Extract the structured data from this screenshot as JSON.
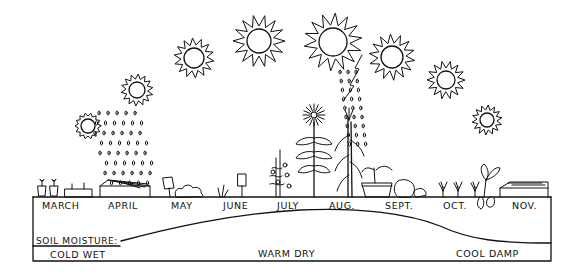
{
  "diagram": {
    "type": "garden-season-illustration",
    "months": [
      {
        "label": "MARCH",
        "x": 42
      },
      {
        "label": "APRIL",
        "x": 108
      },
      {
        "label": "MAY",
        "x": 171
      },
      {
        "label": "JUNE",
        "x": 223
      },
      {
        "label": "JULY",
        "x": 277
      },
      {
        "label": "AUG.",
        "x": 329
      },
      {
        "label": "SEPT.",
        "x": 385
      },
      {
        "label": "OCT.",
        "x": 443
      },
      {
        "label": "NOV.",
        "x": 512
      }
    ],
    "soil_moisture": {
      "label": "SOIL MOISTURE:",
      "zones": [
        {
          "label": "COLD WET",
          "x": 50
        },
        {
          "label": "WARM DRY",
          "x": 258
        },
        {
          "label": "COOL DAMP",
          "x": 456
        }
      ]
    },
    "suns": [
      {
        "cx": 88,
        "cy": 126,
        "r": 7,
        "ray": 6
      },
      {
        "cx": 137,
        "cy": 90,
        "r": 8,
        "ray": 8
      },
      {
        "cx": 194,
        "cy": 58,
        "r": 10,
        "ray": 10
      },
      {
        "cx": 259,
        "cy": 41,
        "r": 12,
        "ray": 14
      },
      {
        "cx": 333,
        "cy": 42,
        "r": 14,
        "ray": 15
      },
      {
        "cx": 392,
        "cy": 57,
        "r": 11,
        "ray": 12
      },
      {
        "cx": 446,
        "cy": 80,
        "r": 9,
        "ray": 10
      },
      {
        "cx": 487,
        "cy": 120,
        "r": 7,
        "ray": 8
      }
    ],
    "colors": {
      "ink": "#111111",
      "paper": "#ffffff"
    }
  }
}
